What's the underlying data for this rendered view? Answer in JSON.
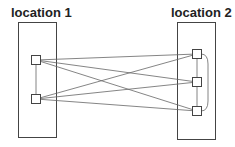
{
  "diagram": {
    "locations": [
      {
        "id": "loc1",
        "label": "location 1",
        "box": {
          "x": 18,
          "y": 22,
          "w": 38,
          "h": 115
        },
        "nodes": [
          {
            "id": "a1",
            "cx": 36,
            "cy": 60
          },
          {
            "id": "a2",
            "cx": 36,
            "cy": 99
          }
        ]
      },
      {
        "id": "loc2",
        "label": "location 2",
        "box": {
          "x": 177,
          "y": 22,
          "w": 38,
          "h": 117
        },
        "nodes": [
          {
            "id": "b1",
            "cx": 197,
            "cy": 54
          },
          {
            "id": "b2",
            "cx": 197,
            "cy": 82
          },
          {
            "id": "b3",
            "cx": 197,
            "cy": 111
          }
        ]
      }
    ],
    "edges": [
      [
        "a1",
        "a2"
      ],
      [
        "b1",
        "b2"
      ],
      [
        "b2",
        "b3"
      ],
      [
        "a1",
        "b1"
      ],
      [
        "a1",
        "b2"
      ],
      [
        "a1",
        "b3"
      ],
      [
        "a2",
        "b1"
      ],
      [
        "a2",
        "b2"
      ],
      [
        "a2",
        "b3"
      ]
    ],
    "curved_edges": [
      [
        "b1",
        "b3"
      ]
    ],
    "colors": {
      "stroke": "#444444",
      "line": "#666666",
      "text": "#222222"
    }
  }
}
